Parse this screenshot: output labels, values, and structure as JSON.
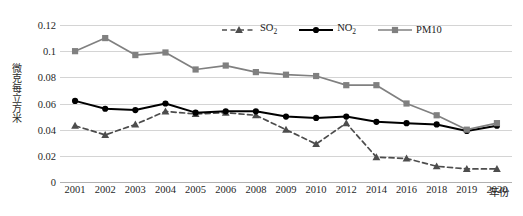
{
  "chart_data": {
    "type": "line",
    "title": "",
    "xlabel": "年份",
    "ylabel": "微克每立方米",
    "categories": [
      "2001",
      "2002",
      "2003",
      "2004",
      "2005",
      "2006",
      "2008",
      "2009",
      "2010",
      "2012",
      "2014",
      "2016",
      "2018",
      "2019",
      "2020"
    ],
    "ylim": [
      0,
      0.12
    ],
    "yticks": [
      "0",
      "0.02",
      "0.04",
      "0.06",
      "0.08",
      "0.1",
      "0.12"
    ],
    "ytick_values": [
      0,
      0.02,
      0.04,
      0.06,
      0.08,
      0.1,
      0.12
    ],
    "grid": true,
    "legend_position": "top-center",
    "series": [
      {
        "name": "SO2",
        "label_main": "SO",
        "label_sub": "2",
        "color": "#4d4d4d",
        "marker": "triangle",
        "dash": true,
        "values": [
          0.043,
          0.036,
          0.044,
          0.054,
          0.052,
          0.053,
          0.051,
          0.04,
          0.029,
          0.045,
          0.019,
          0.018,
          0.012,
          0.01,
          0.01
        ]
      },
      {
        "name": "NO2",
        "label_main": "NO",
        "label_sub": "2",
        "color": "#000000",
        "marker": "circle",
        "dash": false,
        "values": [
          0.062,
          0.056,
          0.055,
          0.06,
          0.053,
          0.054,
          0.054,
          0.05,
          0.049,
          0.05,
          0.046,
          0.045,
          0.044,
          0.039,
          0.043
        ]
      },
      {
        "name": "PM10",
        "label_main": "PM10",
        "label_sub": "",
        "color": "#808080",
        "marker": "square",
        "dash": false,
        "values": [
          0.1,
          0.11,
          0.097,
          0.099,
          0.086,
          0.089,
          0.084,
          0.082,
          0.081,
          0.074,
          0.074,
          0.06,
          0.051,
          0.04,
          0.045
        ]
      }
    ]
  }
}
